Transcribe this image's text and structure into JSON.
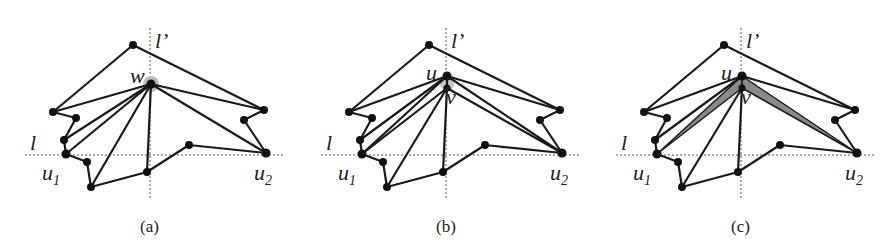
{
  "figure": {
    "panels": [
      {
        "id": "a",
        "caption": "(a)",
        "apex_label": "w",
        "offset_x": 0
      },
      {
        "id": "b",
        "caption": "(b)",
        "apex_label": "u",
        "second_label": "v",
        "offset_x": 296
      },
      {
        "id": "c",
        "caption": "(c)",
        "apex_label": "u",
        "second_label": "v",
        "offset_x": 591
      }
    ],
    "labels": {
      "line_horizontal": "l",
      "line_vertical": "l’",
      "u1": "u",
      "u1_sub": "1",
      "u2": "u",
      "u2_sub": "2"
    },
    "colors": {
      "edge": "#1a1a1a",
      "highlight": "#9a9a9a",
      "axis": "#555555"
    }
  }
}
